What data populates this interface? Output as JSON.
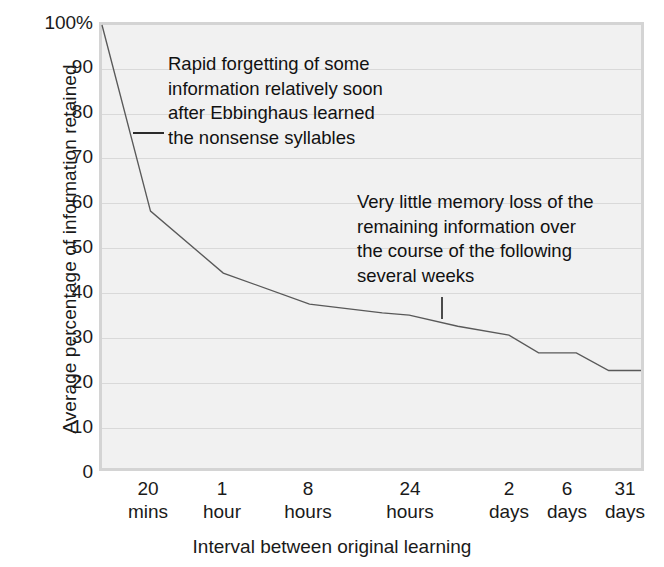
{
  "chart_data": {
    "type": "line",
    "title": "",
    "xlabel": "Interval between original learning",
    "ylabel": "Average percentage of information retained",
    "ylim": [
      0,
      100
    ],
    "grid": true,
    "legend": "none",
    "categories": [
      "20 mins",
      "1 hour",
      "8 hours",
      "24 hours",
      "2 days",
      "6 days",
      "31 days"
    ],
    "x_tick_numbers": [
      "20",
      "1",
      "8",
      "24",
      "2",
      "6",
      "31"
    ],
    "x_tick_units": [
      "mins",
      "hour",
      "hours",
      "hours",
      "days",
      "days",
      "days"
    ],
    "y_ticks": [
      "100%",
      "90",
      "80",
      "70",
      "60",
      "50",
      "40",
      "30",
      "20",
      "10",
      "0"
    ],
    "y_tick_values": [
      100,
      90,
      80,
      70,
      60,
      50,
      40,
      30,
      20,
      10,
      0
    ],
    "series": [
      {
        "name": "Retention",
        "points": [
          {
            "x": 0.0,
            "label": "immediately after learning",
            "y": 100
          },
          {
            "x": 9.0,
            "label": "20 mins",
            "y": 58
          },
          {
            "x": 22.5,
            "label": "1 hour",
            "y": 44
          },
          {
            "x": 38.5,
            "label": "8 hours",
            "y": 37
          },
          {
            "x": 52.0,
            "label": "",
            "y": 35
          },
          {
            "x": 57.0,
            "label": "24 hours",
            "y": 34.5
          },
          {
            "x": 66.0,
            "label": "",
            "y": 32
          },
          {
            "x": 75.5,
            "label": "2 days",
            "y": 30
          },
          {
            "x": 81.0,
            "label": "",
            "y": 26
          },
          {
            "x": 88.0,
            "label": "6 days",
            "y": 26
          },
          {
            "x": 94.0,
            "label": "",
            "y": 22
          },
          {
            "x": 100.0,
            "label": "31 days",
            "y": 22
          }
        ]
      }
    ],
    "annotations": [
      {
        "id": "rapid-forgetting",
        "text": "Rapid forgetting of some\ninformation relatively soon\nafter Ebbinghaus learned\nthe nonsense syllables",
        "leader": "dash"
      },
      {
        "id": "little-loss",
        "text": "Very little memory loss of the\nremaining information over\nthe course of the following\nseveral weeks",
        "leader": "tick"
      }
    ],
    "colors": {
      "line": "#595959",
      "plot_background": "#f1f1f1",
      "gridline": "#d9d9d9",
      "plot_border": "#d4d4d4",
      "text": "#1a1a1a"
    }
  }
}
